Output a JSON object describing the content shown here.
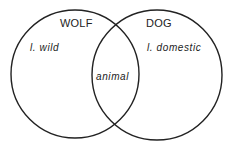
{
  "diagram": {
    "type": "venn",
    "stroke_color": "#222222",
    "background": "#ffffff",
    "sets": [
      {
        "name": "WOLF",
        "attributes": [
          "l. wild"
        ],
        "circle": {
          "cx": 75,
          "cy": 74,
          "r": 64
        }
      },
      {
        "name": "DOG",
        "attributes": [
          "l. domestic"
        ],
        "circle": {
          "cx": 157,
          "cy": 75,
          "r": 65
        }
      }
    ],
    "intersection": {
      "sets": [
        "WOLF",
        "DOG"
      ],
      "attributes": [
        "animal"
      ]
    }
  }
}
